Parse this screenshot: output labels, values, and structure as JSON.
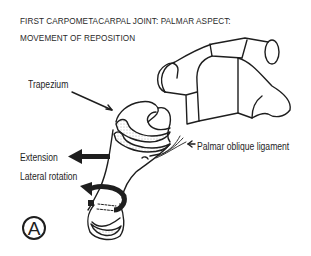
{
  "figure": {
    "title_line1": "FIRST CARPOMETACARPAL JOINT: PALMAR ASPECT:",
    "title_line2": "MOVEMENT OF REPOSITION",
    "panel_label": "A"
  },
  "labels": {
    "trapezium": "Trapezium",
    "extension": "Extension",
    "lateral_rotation": "Lateral rotation",
    "palmar_oblique_ligament": "Palmar oblique ligament"
  },
  "colors": {
    "ink": "#1e1e1e",
    "background": "#ffffff"
  }
}
